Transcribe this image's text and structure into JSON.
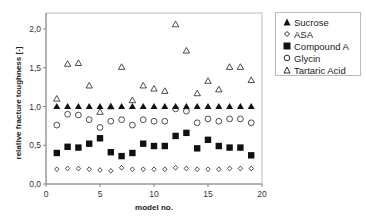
{
  "chart_data": {
    "type": "scatter",
    "title": "",
    "xlabel": "model no.",
    "ylabel": "relative fracture toughness [-]",
    "xlim": [
      0,
      20
    ],
    "ylim": [
      0.0,
      2.0
    ],
    "x_ticks": [
      "0",
      "5",
      "10",
      "15",
      "20"
    ],
    "y_ticks": [
      "0,0",
      "0,5",
      "1,0",
      "1,5",
      "2,0"
    ],
    "grid": false,
    "legend_position": "right-top",
    "x": [
      1,
      2,
      3,
      4,
      5,
      6,
      7,
      8,
      9,
      10,
      11,
      12,
      13,
      14,
      15,
      16,
      17,
      18,
      19
    ],
    "series": [
      {
        "name": "Sucrose",
        "marker": "filled-triangle",
        "values": [
          1.0,
          1.0,
          1.0,
          1.0,
          1.0,
          1.0,
          1.0,
          1.0,
          1.0,
          1.0,
          1.0,
          1.0,
          1.0,
          1.0,
          1.0,
          1.0,
          1.0,
          1.0,
          1.0
        ]
      },
      {
        "name": "ASA",
        "marker": "small-open-diamond",
        "values": [
          0.19,
          0.2,
          0.2,
          0.19,
          0.18,
          0.17,
          0.21,
          0.19,
          0.19,
          0.19,
          0.19,
          0.21,
          0.2,
          0.19,
          0.19,
          0.19,
          0.2,
          0.2,
          0.2
        ]
      },
      {
        "name": "Compound A",
        "marker": "filled-square",
        "values": [
          0.4,
          0.48,
          0.47,
          0.52,
          0.59,
          0.41,
          0.36,
          0.4,
          0.52,
          0.49,
          0.49,
          0.62,
          0.66,
          0.46,
          0.57,
          0.49,
          0.47,
          0.47,
          0.37
        ]
      },
      {
        "name": "Glycin",
        "marker": "open-circle",
        "values": [
          0.76,
          0.9,
          0.89,
          0.83,
          0.73,
          0.81,
          0.83,
          0.76,
          0.83,
          0.81,
          0.81,
          0.97,
          0.94,
          0.79,
          0.84,
          0.81,
          0.84,
          0.84,
          0.79
        ]
      },
      {
        "name": "Tartaric Acid",
        "marker": "open-triangle",
        "values": [
          1.1,
          1.55,
          1.56,
          1.27,
          0.93,
          1.0,
          1.51,
          1.08,
          1.27,
          1.23,
          1.2,
          2.06,
          1.72,
          1.17,
          1.33,
          1.22,
          1.51,
          1.51,
          1.34
        ]
      }
    ]
  },
  "legend": {
    "items": [
      {
        "label": "Sucrose",
        "marker": "filled-triangle"
      },
      {
        "label": "ASA",
        "marker": "small-open-diamond"
      },
      {
        "label": "Compound A",
        "marker": "filled-square"
      },
      {
        "label": "Glycin",
        "marker": "open-circle"
      },
      {
        "label": "Tartaric Acid",
        "marker": "open-triangle"
      }
    ]
  },
  "axes": {
    "x_title": "model no.",
    "y_title": "relative fracture toughness [-]"
  },
  "colors": {
    "marker": "#111111",
    "axis": "#888888",
    "frame": "#bbbbbb"
  }
}
